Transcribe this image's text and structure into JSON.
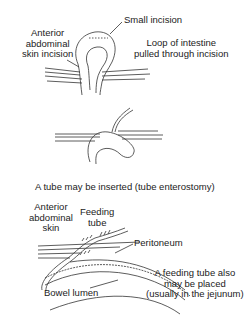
{
  "panel1": {
    "label_skin": [
      "Anterior",
      "abdominal",
      "skin incision"
    ],
    "label_small_incision": "Small incision",
    "label_loop": [
      "Loop of intestine",
      "pulled through incision"
    ]
  },
  "panel2": {
    "caption": "A tube may be inserted (tube enterostomy)"
  },
  "panel3": {
    "label_skin": [
      "Anterior",
      "abdominal",
      "skin"
    ],
    "label_feeding_tube": [
      "Feeding",
      "tube"
    ],
    "label_peritoneum": "Peritoneum",
    "label_bowel_lumen": "Bowel lumen",
    "caption": [
      "A feeding tube also",
      "may be placed",
      "(usually in the jejunum)"
    ]
  },
  "colors": {
    "line": "#333333",
    "text": "#222222",
    "background": "#ffffff"
  }
}
